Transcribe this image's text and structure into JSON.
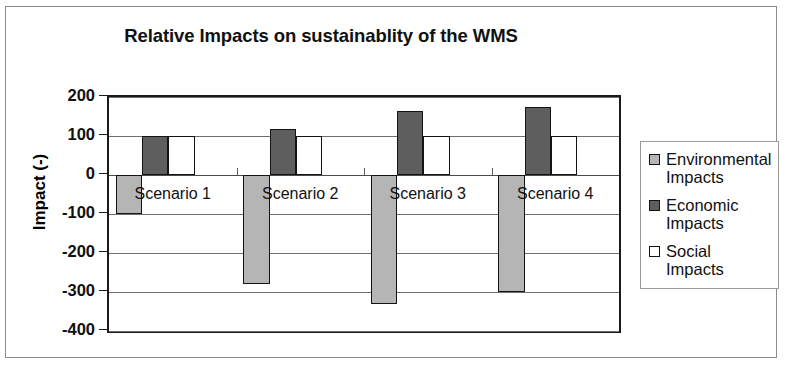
{
  "chart_data": {
    "type": "bar",
    "title": "Relative Impacts on sustainablity of the WMS",
    "xlabel": "",
    "ylabel": "Impact (-)",
    "categories": [
      "Scenario 1",
      "Scenario 2",
      "Scenario 3",
      "Scenario 4"
    ],
    "series": [
      {
        "name": "Environmental Impacts",
        "color": "#b5b5b5",
        "values": [
          -100,
          -280,
          -330,
          -300
        ]
      },
      {
        "name": "Economic Impacts",
        "color": "#5e5e5e",
        "values": [
          100,
          118,
          163,
          175
        ]
      },
      {
        "name": "Social Impacts",
        "color": "#ffffff",
        "values": [
          100,
          100,
          100,
          100
        ]
      }
    ],
    "ylim": [
      -400,
      200
    ],
    "ytick_step": 100,
    "yticks": [
      200,
      100,
      0,
      -100,
      -200,
      -300,
      -400
    ],
    "ytick_labels": [
      "200",
      "100",
      "0",
      "-100",
      "-200",
      "-300",
      "-400"
    ],
    "grid": true,
    "legend_position": "right",
    "legend_entries": [
      {
        "label_line1": "Environmental",
        "label_line2": "Impacts",
        "swatch": "series-0"
      },
      {
        "label_line1": "Economic",
        "label_line2": "Impacts",
        "swatch": "series-1"
      },
      {
        "label_line1": "Social",
        "label_line2": "Impacts",
        "swatch": "series-2"
      }
    ]
  }
}
